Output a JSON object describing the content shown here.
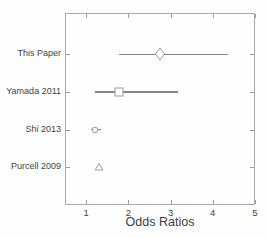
{
  "chart_data": {
    "type": "scatter",
    "subtype": "forest-plot",
    "title": "",
    "xlabel": "Odds Ratios",
    "ylabel": "",
    "xlim": [
      0.5,
      5
    ],
    "x_ticks": [
      1,
      2,
      3,
      4,
      5
    ],
    "grid": false,
    "legend": false,
    "studies": [
      {
        "label": "This Paper",
        "marker": "diamond",
        "odds_ratio": 2.75,
        "ci": [
          1.78,
          4.37
        ]
      },
      {
        "label": "Yamada 2011",
        "marker": "square",
        "odds_ratio": 1.79,
        "ci": [
          1.21,
          3.17
        ]
      },
      {
        "label": "Shi 2013",
        "marker": "circle",
        "odds_ratio": 1.22,
        "ci": [
          1.12,
          1.35
        ]
      },
      {
        "label": "Purcell 2009",
        "marker": "triangle",
        "odds_ratio": 1.31,
        "ci": null
      }
    ]
  },
  "colors": {
    "ci_line": "#848484",
    "marker_stroke": "#9a9a9a",
    "marker_fill": "#ffffff",
    "axis_box": "#a9a9a9",
    "tick": "#9b9b9b",
    "text": "#424242",
    "background": "#fefefe"
  }
}
